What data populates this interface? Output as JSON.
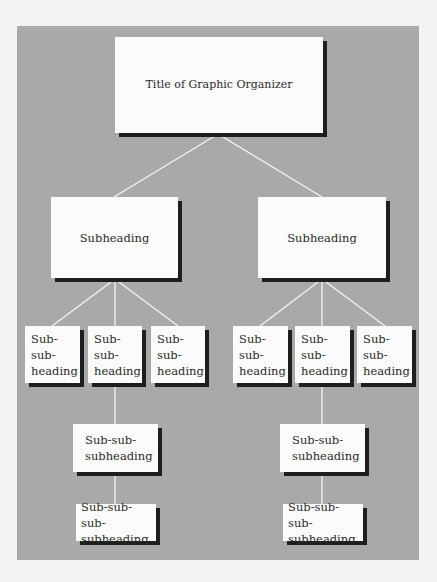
{
  "diagram": {
    "type": "hierarchy-organizer",
    "colors": {
      "background_page": "#f3f3f3",
      "background_panel": "#a9a9a9",
      "box_fill": "#fbfbfb",
      "box_shadow": "#1e1e1e",
      "connector": "#f5f5f5",
      "text": "#2a2a2a"
    },
    "title": "Title of Graphic Organizer",
    "branches": [
      {
        "subheading": "Subheading",
        "children": [
          "Sub-sub-\nheading",
          "Sub-sub-\nheading",
          "Sub-sub-\nheading"
        ],
        "sub_sub_subheading": "Sub-sub-\nsubheading",
        "sub_sub_sub_subheading": "Sub-sub-sub-\nsubheading"
      },
      {
        "subheading": "Subheading",
        "children": [
          "Sub-sub-\nheading",
          "Sub-sub-\nheading",
          "Sub-sub-\nheading"
        ],
        "sub_sub_subheading": "Sub-sub-\nsubheading",
        "sub_sub_sub_subheading": "Sub-sub-sub-\nsubheading"
      }
    ]
  }
}
